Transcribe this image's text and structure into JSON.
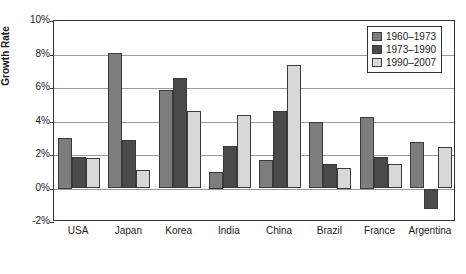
{
  "chart_data": {
    "type": "bar",
    "title": "",
    "xlabel": "",
    "ylabel": "Growth Rate",
    "ylim": [
      -2,
      10
    ],
    "ytick_labels": [
      "10%",
      "8%",
      "6%",
      "4%",
      "2%",
      "0%",
      "-2%"
    ],
    "ytick_values": [
      10,
      8,
      6,
      4,
      2,
      0,
      -2
    ],
    "grid": true,
    "legend_position": "top-right",
    "categories": [
      "USA",
      "Japan",
      "Korea",
      "India",
      "China",
      "Brazil",
      "France",
      "Argentina"
    ],
    "series": [
      {
        "name": "1960–1973",
        "color": "#7d7d7d",
        "values": [
          3.0,
          8.1,
          5.9,
          1.0,
          1.7,
          3.95,
          4.25,
          2.8
        ]
      },
      {
        "name": "1973–1990",
        "color": "#4a4a4a",
        "values": [
          1.9,
          2.9,
          6.6,
          2.55,
          4.65,
          1.45,
          1.9,
          -1.2
        ]
      },
      {
        "name": "1990–2007",
        "color": "#d8d8d8",
        "values": [
          1.8,
          1.1,
          4.6,
          4.4,
          7.35,
          1.25,
          1.45,
          2.45
        ]
      }
    ]
  }
}
